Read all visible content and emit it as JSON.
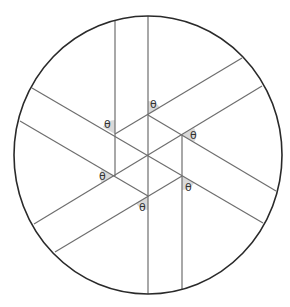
{
  "figure": {
    "colors": {
      "circle": "#2a2a2a",
      "lines": "#6e6e6e",
      "angle_shading": "#d9d9d9",
      "label": "#333333"
    },
    "circle": {
      "cx": 148,
      "cy": 155,
      "rx": 134,
      "ry": 139
    },
    "angle_label": "θ",
    "angles": [
      {
        "label": "θ",
        "x": 154,
        "y": 108
      },
      {
        "label": "θ",
        "x": 108,
        "y": 128
      },
      {
        "label": "θ",
        "x": 194,
        "y": 139
      },
      {
        "label": "θ",
        "x": 103,
        "y": 180
      },
      {
        "label": "θ",
        "x": 189,
        "y": 191
      },
      {
        "label": "θ",
        "x": 143,
        "y": 211
      }
    ]
  }
}
